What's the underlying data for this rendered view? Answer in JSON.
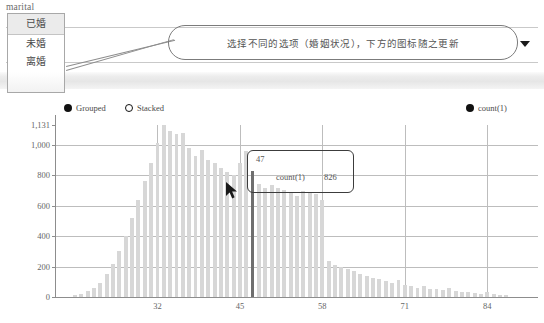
{
  "field": {
    "label": "marital",
    "caret_icon": "chevron-down-icon",
    "options": [
      "已婚",
      "未婚",
      "离婚"
    ],
    "selected": "已婚"
  },
  "callout": {
    "text": "选择不同的选项（婚姻状况），下方的图标随之更新"
  },
  "legend": {
    "mode_grouped": "Grouped",
    "mode_stacked": "Stacked",
    "selected_mode": "Grouped",
    "measure": "count(1)"
  },
  "tooltip": {
    "title": "47",
    "key": "count(1)",
    "value": "826"
  },
  "colors": {
    "bar": "#d7d7d7",
    "bar_highlight": "#6e6e6e",
    "grid": "#bdbdbd",
    "axis": "#8d8d8d",
    "text": "#555555"
  },
  "chart_data": {
    "type": "bar",
    "title": "",
    "subtitle": "",
    "xlabel": "",
    "ylabel": "",
    "grid": true,
    "legend_position": "top",
    "ylim": [
      0,
      1131
    ],
    "yticks": [
      "0",
      "200",
      "400",
      "600",
      "800",
      "1,000",
      "1,131"
    ],
    "ytick_values": [
      0,
      200,
      400,
      600,
      800,
      1000,
      1131
    ],
    "xticks": [
      "32",
      "45",
      "58",
      "71",
      "84"
    ],
    "xtick_values": [
      32,
      45,
      58,
      71,
      84
    ],
    "highlight_x": 47,
    "highlight_value": 826,
    "series": [
      {
        "name": "count(1)",
        "x": [
          19,
          20,
          21,
          22,
          23,
          24,
          25,
          26,
          27,
          28,
          29,
          30,
          31,
          32,
          33,
          34,
          35,
          36,
          37,
          38,
          39,
          40,
          41,
          42,
          43,
          44,
          45,
          46,
          47,
          48,
          49,
          50,
          51,
          52,
          53,
          54,
          55,
          56,
          57,
          58,
          59,
          60,
          61,
          62,
          63,
          64,
          65,
          66,
          67,
          68,
          69,
          70,
          71,
          72,
          73,
          74,
          75,
          76,
          77,
          78,
          79,
          80,
          81,
          82,
          83,
          84,
          85,
          86,
          87
        ],
        "values": [
          12,
          22,
          38,
          60,
          95,
          150,
          215,
          300,
          400,
          520,
          640,
          760,
          880,
          1010,
          1131,
          1090,
          1075,
          1080,
          980,
          930,
          965,
          900,
          880,
          850,
          825,
          805,
          880,
          960,
          826,
          740,
          720,
          735,
          715,
          705,
          690,
          665,
          700,
          690,
          680,
          640,
          240,
          210,
          195,
          185,
          170,
          150,
          140,
          125,
          120,
          105,
          95,
          110,
          80,
          70,
          60,
          75,
          55,
          50,
          45,
          60,
          40,
          35,
          30,
          25,
          20,
          30,
          18,
          12,
          10
        ]
      }
    ]
  }
}
